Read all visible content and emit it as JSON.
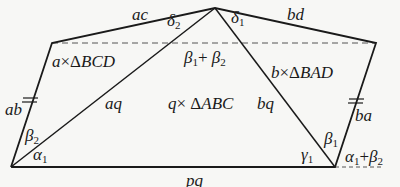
{
  "diagram": {
    "type": "geometry-figure",
    "colors": {
      "stroke": "#1a1a1a",
      "dashed": "#555555",
      "background": "#f7f7f5"
    },
    "vertices": {
      "apex": [
        215,
        8
      ],
      "upper_left": [
        52,
        43
      ],
      "upper_right": [
        376,
        43
      ],
      "bottom_left": [
        11,
        167
      ],
      "bottom_right": [
        335,
        167
      ]
    },
    "edge_labels": {
      "ac": "ac",
      "bd": "bd",
      "ab": "ab",
      "ba": "ba",
      "aq": "aq",
      "bq": "bq",
      "pq": "pq"
    },
    "region_labels": {
      "left": {
        "coef": "a",
        "times": "×",
        "delta": "Δ",
        "name": "BCD"
      },
      "center": {
        "coef": "q",
        "times": "×",
        "delta": "Δ",
        "name": "ABC"
      },
      "right": {
        "coef": "b",
        "times": "×",
        "delta": "Δ",
        "name": "BAD"
      }
    },
    "angle_labels": {
      "delta2": {
        "sym": "δ",
        "sub": "2"
      },
      "delta1": {
        "sym": "δ",
        "sub": "1"
      },
      "beta1_plus_beta2": {
        "a": "β",
        "a_sub": "1",
        "op": "+",
        "b": "β",
        "b_sub": "2"
      },
      "beta2_left": {
        "sym": "β",
        "sub": "2"
      },
      "alpha1_left": {
        "sym": "α",
        "sub": "1"
      },
      "gamma1": {
        "sym": "γ",
        "sub": "1"
      },
      "beta1_right": {
        "sym": "β",
        "sub": "1"
      },
      "alpha1_plus_beta2": {
        "a": "α",
        "a_sub": "1",
        "op": "+",
        "b": "β",
        "b_sub": "2"
      }
    },
    "tick_marks": {
      "equal_sides": [
        "ab",
        "ba"
      ],
      "count_each": 2
    }
  }
}
